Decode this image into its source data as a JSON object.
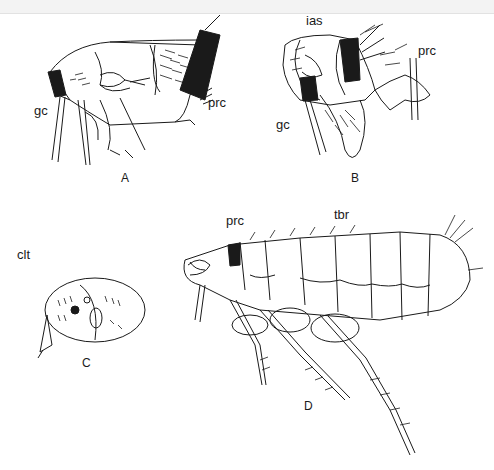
{
  "figure": {
    "panels": [
      {
        "id": "A",
        "label": "A",
        "callouts": [
          "gc",
          "prc"
        ]
      },
      {
        "id": "B",
        "label": "B",
        "callouts": [
          "ias",
          "prc",
          "gc"
        ]
      },
      {
        "id": "C",
        "label": "C",
        "callouts": [
          "clt"
        ]
      },
      {
        "id": "D",
        "label": "D",
        "callouts": [
          "prc",
          "tbr"
        ]
      }
    ],
    "labels": {
      "a_gc": "gc",
      "a_prc": "prc",
      "b_ias": "ias",
      "b_prc": "prc",
      "b_gc": "gc",
      "c_clt": "clt",
      "d_prc": "prc",
      "d_tbr": "tbr"
    },
    "colors": {
      "ink": "#1a1a1a",
      "paper": "#ffffff"
    }
  }
}
